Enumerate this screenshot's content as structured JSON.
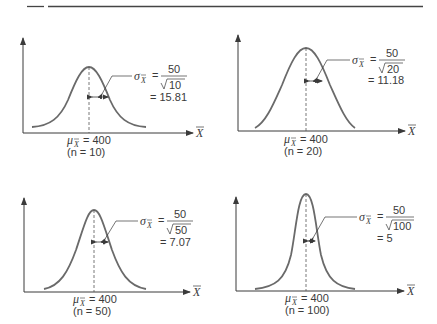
{
  "figure": {
    "colors": {
      "curve": "#6a6a6a",
      "axis": "#3a3a3a",
      "rule": "#444444",
      "text": "#3a3a3a"
    },
    "axis_label": "X",
    "mean_symbol": "μ",
    "sigma_symbol": "σ",
    "panels": [
      {
        "id": "n10",
        "mean_label": "= 400",
        "n_label": "(n   = 10)",
        "numerator": "50",
        "denominator": "10",
        "result": "= 15.81",
        "n": 10,
        "sigma": 15.81
      },
      {
        "id": "n20",
        "mean_label": "= 400",
        "n_label": "(n   = 20)",
        "numerator": "50",
        "denominator": "20",
        "result": "= 11.18",
        "n": 20,
        "sigma": 11.18
      },
      {
        "id": "n50",
        "mean_label": "= 400",
        "n_label": "(n   = 50)",
        "numerator": "50",
        "denominator": "50",
        "result": "= 7.07",
        "n": 50,
        "sigma": 7.07
      },
      {
        "id": "n100",
        "mean_label": "= 400",
        "n_label": "(n   = 100)",
        "numerator": "50",
        "denominator": "100",
        "result": "= 5",
        "n": 100,
        "sigma": 5
      }
    ]
  }
}
